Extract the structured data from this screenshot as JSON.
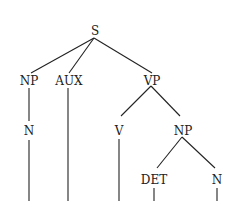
{
  "tree": {
    "root": "S",
    "nodes": {
      "s": "S",
      "np1": "NP",
      "aux": "AUX",
      "vp": "VP",
      "n1": "N",
      "v": "V",
      "np2": "NP",
      "det": "DET",
      "n2": "N"
    }
  }
}
